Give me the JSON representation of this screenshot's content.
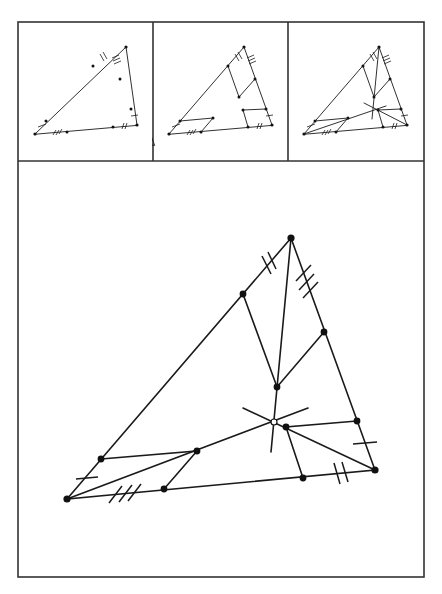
{
  "figure": {
    "layout": {
      "frame": [
        18,
        22,
        424,
        577
      ],
      "row_divider_y": 161,
      "column_dividers_x": [
        153,
        288
      ]
    },
    "panels": [
      {
        "id": "panel-1",
        "step": 1,
        "description": "Triangle with trisection points marked on each side, equal-length tick marks (single, double, triple)"
      },
      {
        "id": "panel-2",
        "step": 2,
        "description": "Parallelograms constructed at each vertex using the trisection points"
      },
      {
        "id": "panel-3",
        "step": 3,
        "description": "Lines from vertices through parallelogram corners meet at a common point"
      }
    ],
    "main": {
      "vertices": {
        "A": [
          67,
          499
        ],
        "B": [
          291,
          238
        ],
        "C": [
          375,
          470
        ]
      },
      "side_points": {
        "AB_near_A": [
          101,
          459
        ],
        "AB_near_B": [
          243,
          294
        ],
        "BC_near_B": [
          324,
          332
        ],
        "BC_near_C": [
          357,
          421
        ],
        "CA_near_A": [
          164,
          489
        ],
        "CA_near_C": [
          303,
          478
        ]
      },
      "interior_points": {
        "Q_B": [
          277,
          387
        ],
        "Q_A": [
          197,
          451
        ],
        "Q_C": [
          286,
          427
        ]
      },
      "center": {
        "O": [
          274,
          422
        ],
        "style": "open-circle"
      },
      "tick_marks": {
        "AB": "double",
        "BC": "triple",
        "CA_segment": "triple",
        "C_side": "double",
        "A_side": "single",
        "BC_lower": "single"
      }
    },
    "colors": {
      "line": "#1a1a1a",
      "frame": "#333333",
      "background": "#ffffff"
    }
  },
  "caption": {
    "text": ""
  }
}
